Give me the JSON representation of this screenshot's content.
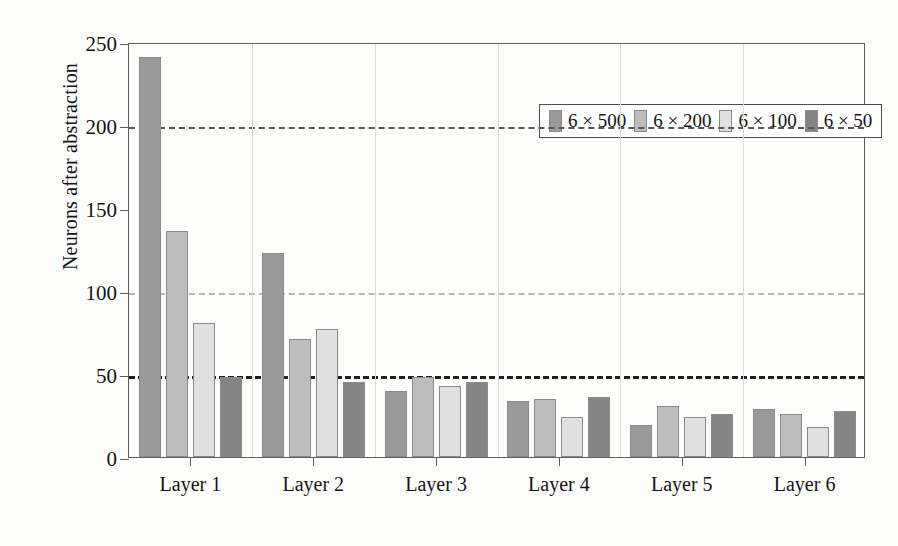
{
  "chart_data": {
    "type": "bar",
    "title": "",
    "xlabel": "",
    "ylabel": "Neurons after abstraction",
    "categories": [
      "Layer 1",
      "Layer 2",
      "Layer 3",
      "Layer 4",
      "Layer 5",
      "Layer 6"
    ],
    "ylim": [
      0,
      250
    ],
    "yticks": [
      0,
      50,
      100,
      150,
      200,
      250
    ],
    "ytick_labels": [
      "0",
      "50",
      "100",
      "150",
      "200",
      "250"
    ],
    "grid": "horizontal dashed at 50, 100, 200; light vertical separators between layer groups",
    "legend_position": "top-center inside plot",
    "series": [
      {
        "name": "6 × 500",
        "color": "#9a9a9a",
        "values": [
          241,
          123,
          40,
          34,
          19,
          29
        ]
      },
      {
        "name": "6 × 200",
        "color": "#bdbdbd",
        "values": [
          136,
          71,
          48,
          35,
          31,
          26
        ]
      },
      {
        "name": "6 × 100",
        "color": "#e0e0e0",
        "values": [
          81,
          77,
          43,
          24,
          24,
          18
        ]
      },
      {
        "name": "6 × 50",
        "color": "#858585",
        "values": [
          48,
          45,
          45,
          36,
          26,
          28
        ]
      }
    ]
  },
  "colors": {
    "frame": "#5d5d5d",
    "text": "#141414",
    "grid_50": "#1f1f1f",
    "grid_100": "#b7b7b7",
    "grid_200": "#565656",
    "vgrid": "#dadada",
    "bar_edge": "#8a8a8a",
    "background": "#fdfdfc"
  }
}
